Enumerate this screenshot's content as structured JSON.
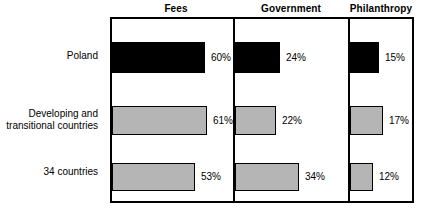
{
  "chart_data": {
    "type": "bar",
    "title": "",
    "orientation": "horizontal",
    "grid": false,
    "legend": null,
    "xlabel": "",
    "ylabel": "",
    "categories": [
      "Poland",
      "Developing and\ntransitional countries",
      "34 countries"
    ],
    "columns": [
      "Fees",
      "Government",
      "Philanthropy"
    ],
    "series": [
      {
        "name": "Fees",
        "values": [
          60,
          61,
          53
        ],
        "labels": [
          "60%",
          "61%",
          "53%"
        ]
      },
      {
        "name": "Government",
        "values": [
          24,
          22,
          34
        ],
        "labels": [
          "24%",
          "22%",
          "34%"
        ]
      },
      {
        "name": "Philanthropy",
        "values": [
          15,
          17,
          12
        ],
        "labels": [
          "15%",
          "17%",
          "12%"
        ]
      }
    ],
    "row_styles": [
      "black",
      "gray",
      "gray"
    ],
    "units": "percent"
  },
  "headers": [
    {
      "label": "Fees"
    },
    {
      "label": "Government"
    },
    {
      "label": "Philanthropy"
    }
  ],
  "rows": [
    {
      "label": "Poland",
      "style": "black",
      "cells": [
        {
          "column": "Fees",
          "value": 60,
          "label": "60%"
        },
        {
          "column": "Government",
          "value": 24,
          "label": "24%"
        },
        {
          "column": "Philanthropy",
          "value": 15,
          "label": "15%"
        }
      ]
    },
    {
      "label": "Developing and\ntransitional countries",
      "style": "gray",
      "cells": [
        {
          "column": "Fees",
          "value": 61,
          "label": "61%"
        },
        {
          "column": "Government",
          "value": 22,
          "label": "22%"
        },
        {
          "column": "Philanthropy",
          "value": 17,
          "label": "17%"
        }
      ]
    },
    {
      "label": "34 countries",
      "style": "gray",
      "cells": [
        {
          "column": "Fees",
          "value": 53,
          "label": "53%"
        },
        {
          "column": "Government",
          "value": 34,
          "label": "34%"
        },
        {
          "column": "Philanthropy",
          "value": 12,
          "label": "12%"
        }
      ]
    }
  ],
  "colors": {
    "bar_black": "#000000",
    "bar_gray": "#b5b5b5",
    "border": "#000000",
    "background": "#ffffff"
  }
}
